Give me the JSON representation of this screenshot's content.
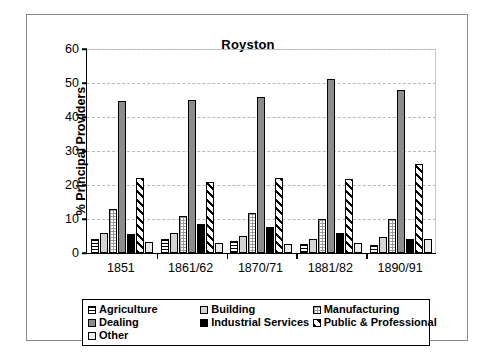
{
  "chart_data": {
    "type": "bar",
    "title": "Royston",
    "xlabel": "",
    "ylabel": "% Principal Providers",
    "ylim": [
      0,
      60
    ],
    "yticks": [
      0,
      10,
      20,
      30,
      40,
      50,
      60
    ],
    "grid": true,
    "legend_position": "bottom",
    "categories": [
      "1851",
      "1861/62",
      "1870/71",
      "1881/82",
      "1890/91"
    ],
    "series": [
      {
        "name": "Agriculture",
        "pattern": "horizontal-lines",
        "values": [
          4.0,
          4.2,
          3.6,
          2.6,
          2.4
        ]
      },
      {
        "name": "Building",
        "pattern": "light-gray",
        "values": [
          6.0,
          6.0,
          5.0,
          4.2,
          4.6
        ]
      },
      {
        "name": "Manufacturing",
        "pattern": "checkered",
        "values": [
          12.8,
          11.0,
          11.9,
          9.9,
          10.0
        ]
      },
      {
        "name": "Dealing",
        "pattern": "medium-gray",
        "values": [
          44.7,
          45.1,
          45.9,
          51.1,
          47.8
        ]
      },
      {
        "name": "Industrial Services",
        "pattern": "solid-black",
        "values": [
          5.6,
          8.6,
          7.6,
          5.9,
          4.0
        ]
      },
      {
        "name": "Public & Professional",
        "pattern": "diagonal-hatch",
        "values": [
          22.0,
          20.9,
          22.0,
          21.8,
          26.2
        ]
      },
      {
        "name": "Other",
        "pattern": "very-light-gray",
        "values": [
          3.2,
          3.0,
          2.6,
          2.8,
          4.1
        ]
      }
    ]
  },
  "legend": {
    "items": [
      {
        "label": "Agriculture"
      },
      {
        "label": "Building"
      },
      {
        "label": "Manufacturing"
      },
      {
        "label": "Dealing"
      },
      {
        "label": "Industrial Services"
      },
      {
        "label": "Public & Professional"
      },
      {
        "label": "Other"
      }
    ]
  }
}
